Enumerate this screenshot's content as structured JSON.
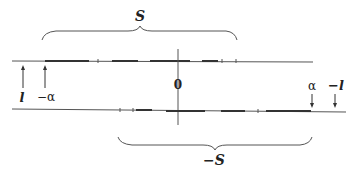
{
  "diagram": {
    "top_brace": {
      "label": "S"
    },
    "bottom_brace": {
      "label": "−S"
    },
    "origin_label": "0",
    "top_line": {
      "arrows": [
        {
          "label": "l"
        },
        {
          "label": "−α"
        }
      ]
    },
    "bottom_line": {
      "arrows": [
        {
          "label": "α"
        },
        {
          "label": "−l"
        }
      ]
    },
    "colors": {
      "stroke": "#333333",
      "thin_line": "#555555"
    }
  }
}
